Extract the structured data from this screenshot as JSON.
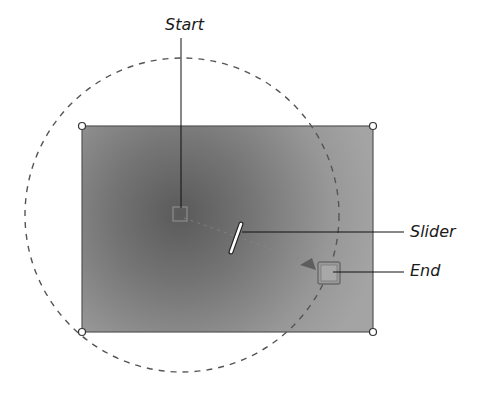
{
  "diagram": {
    "labels": {
      "start": "Start",
      "slider": "Slider",
      "end": "End"
    },
    "canvas": {
      "rect": {
        "x": 82,
        "y": 126,
        "width": 291,
        "height": 206
      },
      "fill_center_color": "#5e5e5e",
      "fill_edge_color": "#a2a2a2",
      "border_color": "#555555"
    },
    "gradient_circle": {
      "cx": 182,
      "cy": 215,
      "r": 157,
      "stroke_color": "#555555",
      "style": "dashed"
    },
    "handles": {
      "corners": [
        "top-left",
        "top-right",
        "bottom-left",
        "bottom-right"
      ],
      "start_point": {
        "x": 180,
        "y": 214
      },
      "slider_point": {
        "x": 236,
        "y": 239
      },
      "end_point": {
        "x": 330,
        "y": 272
      }
    },
    "callouts": {
      "start": {
        "text_x": 166,
        "text_y": 18,
        "line_from": [
          181,
          38
        ],
        "line_to": [
          181,
          207
        ]
      },
      "slider": {
        "text_x": 410,
        "text_y": 226,
        "line_from": [
          242,
          232
        ],
        "line_to": [
          404,
          232
        ]
      },
      "end": {
        "text_x": 410,
        "text_y": 263,
        "line_from": [
          333,
          272
        ],
        "line_to": [
          404,
          272
        ]
      }
    }
  }
}
